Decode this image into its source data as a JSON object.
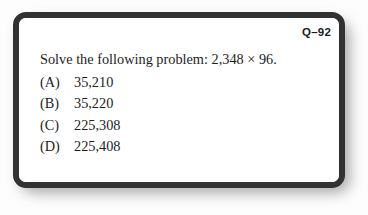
{
  "card": {
    "question_id": "Q–92",
    "prompt": "Solve the following problem: 2,348 × 96.",
    "options": [
      {
        "label": "(A)",
        "value": "35,210"
      },
      {
        "label": "(B)",
        "value": "35,220"
      },
      {
        "label": "(C)",
        "value": "225,308"
      },
      {
        "label": "(D)",
        "value": "225,408"
      }
    ],
    "colors": {
      "page_background": "#fdfdfd",
      "card_background": "#ffffff",
      "border": "#313131",
      "text": "#1d1d1d",
      "shadow": "#8d8d8d"
    }
  }
}
